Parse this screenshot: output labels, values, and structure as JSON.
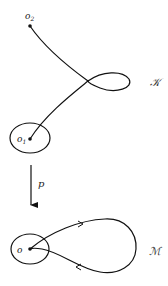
{
  "diagram": {
    "top_space": {
      "label": "𝒦",
      "point_start": {
        "label": "o",
        "sub": "2"
      },
      "point_end": {
        "label": "o",
        "sub": "1"
      }
    },
    "map": {
      "label": "p"
    },
    "bottom_space": {
      "label": "ℳ",
      "point": {
        "label": "o"
      }
    },
    "colors": {
      "stroke": "#111111",
      "background": "#ffffff"
    }
  }
}
